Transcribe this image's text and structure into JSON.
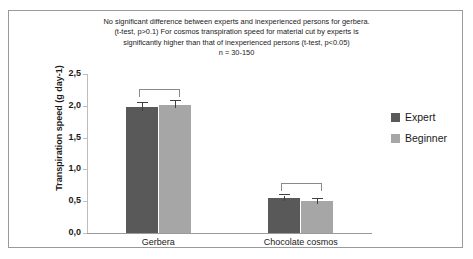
{
  "chart_data": {
    "type": "bar",
    "title_lines": [
      "No significant difference between experts and inexperienced persons for gerbera.",
      "(t-test, p>0.1)   For cosmos transpiration speed for material cut by experts is",
      "significantly higher than that of inexperienced persons (t-test, p<0.05)",
      "n = 30-150"
    ],
    "xlabel": "",
    "ylabel": "Transpiration speed  (g day-1)",
    "categories": [
      "Gerbera",
      "Chocolate cosmos"
    ],
    "series": [
      {
        "name": "Expert",
        "color": "#595959",
        "values": [
          1.98,
          0.55
        ],
        "errors": [
          0.06,
          0.04
        ]
      },
      {
        "name": "Beginner",
        "color": "#a6a6a6",
        "values": [
          2.02,
          0.5
        ],
        "errors": [
          0.06,
          0.04
        ]
      }
    ],
    "ylim": [
      0.0,
      2.5
    ],
    "yticks": [
      0.0,
      0.5,
      1.0,
      1.5,
      2.0,
      2.5
    ],
    "ytick_labels": [
      "0,0",
      "0,5",
      "1,0",
      "1,5",
      "2,0",
      "2,5"
    ],
    "grid": false,
    "legend_position": "right",
    "annotations": [
      {
        "kind": "significance-bracket",
        "group": "Gerbera",
        "label": ""
      },
      {
        "kind": "significance-bracket",
        "group": "Chocolate cosmos",
        "label": ""
      }
    ]
  },
  "legend": {
    "items": [
      {
        "label": "Expert",
        "color": "#595959"
      },
      {
        "label": "Beginner",
        "color": "#a6a6a6"
      }
    ]
  }
}
